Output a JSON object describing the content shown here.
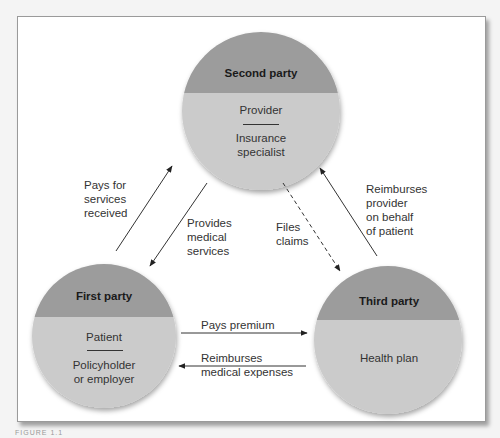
{
  "colors": {
    "circle_top": "#9c9c9c",
    "circle_bottom": "#cbcbcb",
    "arrow": "#333333",
    "frame_bg": "#ffffff"
  },
  "parties": {
    "second": {
      "title": "Second party",
      "role": "Provider",
      "subtitle": "Insurance\nspecialist"
    },
    "first": {
      "title": "First party",
      "role": "Patient",
      "subtitle": "Policyholder\nor employer"
    },
    "third": {
      "title": "Third party",
      "subtitle": "Health plan"
    }
  },
  "arrows": {
    "pays_for_services": "Pays for\nservices\nreceived",
    "provides_medical_services": "Provides\nmedical\nservices",
    "files_claims": "Files\nclaims",
    "reimburses_provider": "Reimburses\nprovider\non behalf\nof patient",
    "pays_premium": "Pays premium",
    "reimburses_expenses": "Reimburses\nmedical expenses"
  },
  "caption": "FIGURE 1.1"
}
